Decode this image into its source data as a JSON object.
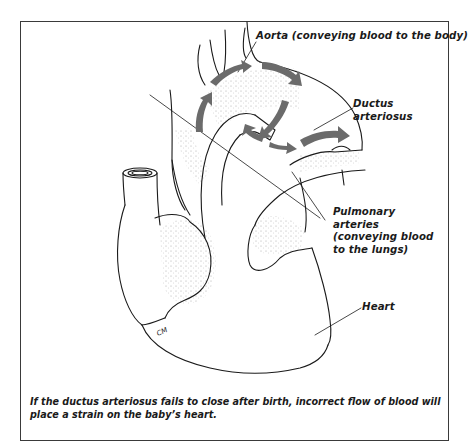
{
  "diagram": {
    "type": "anatomical-illustration",
    "labels": [
      {
        "id": "aorta",
        "text": "Aorta (conveying blood to the body)"
      },
      {
        "id": "ductus",
        "lines": [
          "Ductus",
          "arteriosus"
        ]
      },
      {
        "id": "pulmonary",
        "lines": [
          "Pulmonary",
          "arteries",
          "(conveying blood",
          "to the lungs)"
        ]
      },
      {
        "id": "heart",
        "text": "Heart"
      }
    ],
    "signature": "CM",
    "caption": "If the ductus arteriosus fails to close after birth, incorrect flow of blood will place a strain on the baby’s heart.",
    "colors": {
      "line": "#1a1a1a",
      "arrow": "#6b6b6b",
      "stipple": "#c8c8c8",
      "frame": "#3a3a3a"
    }
  }
}
